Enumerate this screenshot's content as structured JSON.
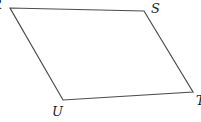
{
  "figure": {
    "type": "geometry-diagram",
    "shape": "quadrilateral-parallelogram",
    "background_color": "#ffffff",
    "outline": {
      "points": "10,8 144,11 193,92 63,100",
      "stroke_color": "#4d4d4d",
      "stroke_width": "1.2",
      "fill": "none"
    },
    "vertices": [
      {
        "label": "R",
        "position": "top-left",
        "note_visible": "partially clipped at left edge"
      },
      {
        "label": "S",
        "position": "top-right"
      },
      {
        "label": "T",
        "position": "bottom-right",
        "note_visible": "partially clipped at right edge"
      },
      {
        "label": "U",
        "position": "bottom-left"
      }
    ],
    "labels": {
      "top_left": "R",
      "top_right": "S",
      "bottom_right": "T",
      "bottom_left": "U"
    }
  }
}
